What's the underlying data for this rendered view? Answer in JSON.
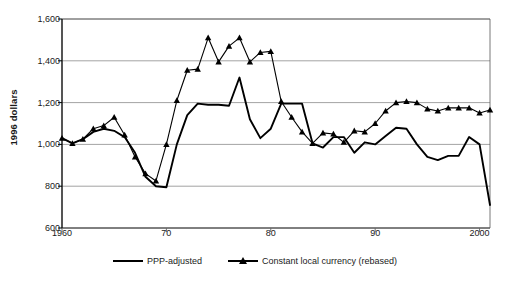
{
  "chart_data": {
    "type": "line",
    "title": "",
    "xlabel": "",
    "ylabel": "1996 dollars",
    "xlim": [
      1960,
      2001
    ],
    "ylim": [
      600,
      1600
    ],
    "ytick_values": [
      600,
      800,
      1000,
      1200,
      1400,
      1600
    ],
    "ytick_labels": [
      "600",
      "800",
      "1,000",
      "1,200",
      "1,400",
      "1,600"
    ],
    "xtick_values": [
      1960,
      1970,
      1980,
      1990,
      2000
    ],
    "xtick_labels": [
      "1960",
      "70",
      "80",
      "90",
      "2000"
    ],
    "grid": "horizontal",
    "legend_position": "bottom",
    "x": [
      1960,
      1961,
      1962,
      1963,
      1964,
      1965,
      1966,
      1967,
      1968,
      1969,
      1970,
      1971,
      1972,
      1973,
      1974,
      1975,
      1976,
      1977,
      1978,
      1979,
      1980,
      1981,
      1982,
      1983,
      1984,
      1985,
      1986,
      1987,
      1988,
      1989,
      1990,
      1991,
      1992,
      1993,
      1994,
      1995,
      1996,
      1997,
      1998,
      1999,
      2000,
      2001
    ],
    "series": [
      {
        "name": "PPP-adjusted",
        "marker": "none",
        "color": "#000000",
        "values": [
          1030,
          1005,
          1025,
          1060,
          1075,
          1065,
          1035,
          960,
          845,
          800,
          795,
          1000,
          1140,
          1195,
          1190,
          1190,
          1185,
          1320,
          1120,
          1030,
          1075,
          1195,
          1195,
          1195,
          1005,
          985,
          1035,
          1035,
          960,
          1010,
          1000,
          1040,
          1080,
          1075,
          1000,
          940,
          925,
          945,
          945,
          1035,
          1000,
          710
        ]
      },
      {
        "name": "Constant local currency (rebased)",
        "marker": "triangle",
        "color": "#000000",
        "values": [
          1030,
          1005,
          1025,
          1075,
          1090,
          1130,
          1045,
          940,
          860,
          825,
          1000,
          1210,
          1355,
          1360,
          1510,
          1395,
          1470,
          1510,
          1395,
          1440,
          1445,
          1205,
          1130,
          1060,
          1005,
          1055,
          1050,
          1010,
          1065,
          1060,
          1100,
          1160,
          1200,
          1205,
          1200,
          1170,
          1160,
          1175,
          1175,
          1175,
          1150,
          1165
        ]
      }
    ]
  },
  "axis": {
    "ylabel": "1996 dollars"
  },
  "legend": {
    "items": [
      {
        "label": "PPP-adjusted"
      },
      {
        "label": "Constant local currency (rebased)"
      }
    ]
  }
}
